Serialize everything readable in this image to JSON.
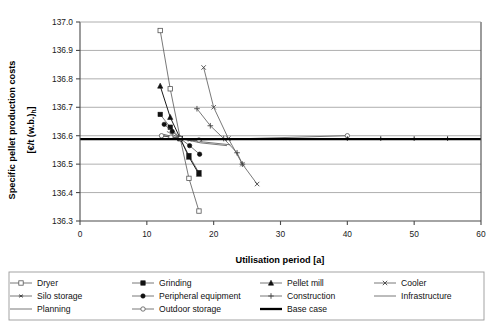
{
  "chart_data": {
    "type": "line",
    "title": "",
    "xlabel": "Utilisation period [a]",
    "ylabel": "Specific pellet production costs [€/t (w.b.)h]",
    "ylabel_line1": "Specific pellet production costs",
    "ylabel_line2": "[€/t (w.b.)h]",
    "xlim": [
      0,
      60
    ],
    "ylim": [
      136.3,
      137.0
    ],
    "xticks": [
      0,
      10,
      20,
      30,
      40,
      50,
      60
    ],
    "yticks": [
      136.3,
      136.4,
      136.5,
      136.6,
      136.7,
      136.8,
      136.9,
      137.0
    ],
    "xtick_labels": [
      "0",
      "10",
      "20",
      "30",
      "40",
      "50",
      "60"
    ],
    "ytick_labels": [
      "136.3",
      "136.4",
      "136.5",
      "136.6",
      "136.7",
      "136.8",
      "136.9",
      "137.0"
    ],
    "grid": "horizontal",
    "legend_position": "bottom",
    "base_value": 136.59,
    "series": [
      {
        "name": "Dryer",
        "marker": "square-hollow",
        "line": "thin",
        "x": [
          12.0,
          13.5,
          15.0,
          16.3,
          17.8
        ],
        "y": [
          136.97,
          136.765,
          136.59,
          136.45,
          136.335
        ]
      },
      {
        "name": "Grinding",
        "marker": "square-filled",
        "line": "thin",
        "x": [
          12.0,
          13.5,
          15.0,
          16.3,
          17.8
        ],
        "y": [
          136.675,
          136.63,
          136.59,
          136.53,
          136.47
        ]
      },
      {
        "name": "Pellet mill",
        "marker": "triangle-filled",
        "line": "dark",
        "x": [
          12.0,
          13.5,
          15.0,
          16.3,
          17.8
        ],
        "y": [
          136.775,
          136.665,
          136.59,
          136.525,
          136.465
        ]
      },
      {
        "name": "Cooler",
        "marker": "x-cross",
        "line": "thin",
        "x": [
          18.5,
          20.0,
          22.2,
          24.3,
          26.5
        ],
        "y": [
          136.84,
          136.7,
          136.59,
          136.5,
          136.43
        ]
      },
      {
        "name": "Silo storage",
        "marker": "asterisk",
        "line": "thin",
        "x": [
          12.2,
          13.6,
          15.0,
          16.4,
          17.9
        ],
        "y": [
          136.6,
          136.595,
          136.59,
          136.585,
          136.583
        ]
      },
      {
        "name": "Peripheral equipment",
        "marker": "circle-filled",
        "line": "thin",
        "x": [
          12.6,
          13.8,
          15.0,
          16.4,
          17.9
        ],
        "y": [
          136.64,
          136.615,
          136.59,
          136.565,
          136.535
        ]
      },
      {
        "name": "Construction",
        "marker": "plus",
        "line": "thin",
        "x": [
          17.5,
          19.5,
          21.5,
          23.5,
          24.3
        ],
        "y": [
          136.695,
          136.635,
          136.59,
          136.54,
          136.5
        ]
      },
      {
        "name": "Infrastructure",
        "marker": "none",
        "line": "thin",
        "x": [
          13.0,
          15.0,
          18.0,
          22.0
        ],
        "y": [
          136.615,
          136.59,
          136.575,
          136.565
        ]
      },
      {
        "name": "Planning",
        "marker": "none",
        "line": "thin",
        "x": [
          12.5,
          15.0,
          18.5,
          22.5
        ],
        "y": [
          136.605,
          136.59,
          136.578,
          136.568
        ]
      },
      {
        "name": "Outdoor storage",
        "marker": "circle-hollow",
        "line": "thin",
        "x": [
          12.2,
          13.6,
          15.0,
          17.8,
          40.0
        ],
        "y": [
          136.6,
          136.595,
          136.59,
          136.585,
          136.6
        ]
      },
      {
        "name": "Base case",
        "marker": "none",
        "line": "thick",
        "x": [
          0.0,
          15.0,
          40.0,
          45.0,
          50.0,
          55.0,
          60.0
        ],
        "y": [
          136.588,
          136.588,
          136.588,
          136.588,
          136.588,
          136.588,
          136.588
        ]
      }
    ],
    "legend_entries": [
      {
        "label": "Dryer",
        "marker": "square-hollow"
      },
      {
        "label": "Grinding",
        "marker": "square-filled"
      },
      {
        "label": "Pellet mill",
        "marker": "triangle-filled"
      },
      {
        "label": "Cooler",
        "marker": "x-cross"
      },
      {
        "label": "Silo storage",
        "marker": "asterisk"
      },
      {
        "label": "Peripheral equipment",
        "marker": "circle-filled"
      },
      {
        "label": "Construction",
        "marker": "plus"
      },
      {
        "label": "Infrastructure",
        "marker": "none"
      },
      {
        "label": "Planning",
        "marker": "none"
      },
      {
        "label": "Outdoor storage",
        "marker": "circle-hollow"
      },
      {
        "label": "Base case",
        "marker": "thick-line"
      }
    ],
    "colors": {
      "line": "#555555",
      "line_dark": "#1c1c1c",
      "base_case": "#000000",
      "grid": "#9a9a9a",
      "axis": "#4a4a4a",
      "background": "#ffffff"
    }
  }
}
